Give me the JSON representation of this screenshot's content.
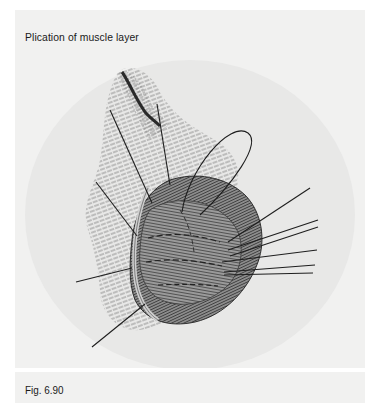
{
  "figure": {
    "title": "Plication of muscle layer",
    "caption": "Fig. 6.90",
    "illustration": "surgical-illustration-plication-muscle-layer"
  },
  "colors": {
    "panel_background": "#f1f1f0",
    "ellipse_background": "#e9e9e8",
    "hatch": "#6f6f6f",
    "tissue_dark": "#4a4a4a",
    "tissue_mid": "#8a8a8a",
    "suture": "#1e1e1e",
    "text": "#1a1a1a"
  }
}
